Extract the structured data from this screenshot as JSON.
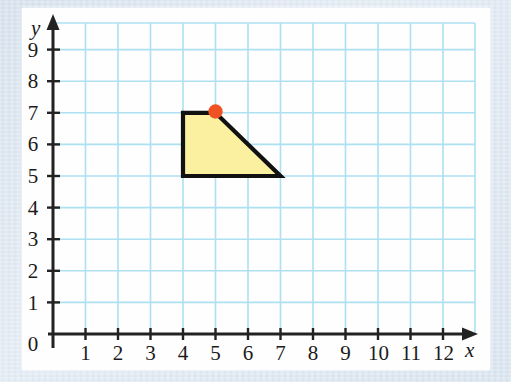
{
  "figure": {
    "kind": "cartesian-coordinate-grid-with-shaded-polygon",
    "x_axis": {
      "name": "x",
      "ticks": [
        "1",
        "2",
        "3",
        "4",
        "5",
        "6",
        "7",
        "8",
        "9",
        "10",
        "11",
        "12"
      ],
      "origin_label": "0",
      "min": 0,
      "max": 12
    },
    "y_axis": {
      "name": "y",
      "ticks": [
        "1",
        "2",
        "3",
        "4",
        "5",
        "6",
        "7",
        "8",
        "9"
      ],
      "min": 0,
      "max": 9
    },
    "shape": {
      "name": "shaded-trapezoid",
      "vertices": [
        [
          4,
          7
        ],
        [
          5,
          7
        ],
        [
          7,
          5
        ],
        [
          4,
          5
        ]
      ],
      "fill_color": "#faf0a0",
      "stroke_color": "#111111"
    },
    "marked_point": {
      "name": "marked-vertex",
      "coordinates": [
        5,
        7
      ],
      "color": "#ef5223"
    },
    "colors": {
      "grid": "#a9dff0",
      "axis": "#222222",
      "plate_background": "#fefefe",
      "page_border": "#d4e0ee"
    }
  }
}
